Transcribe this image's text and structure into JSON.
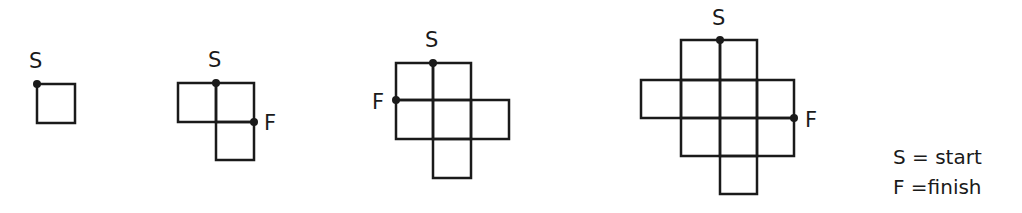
{
  "diagram": {
    "type": "grid-path-figures",
    "stroke_color": "#1a1a1a",
    "background_color": "#ffffff",
    "figures": [
      {
        "id": "figure-1",
        "description": "Single square",
        "cells": [
          [
            0,
            0
          ]
        ],
        "labels": [
          {
            "text": "S",
            "role": "start"
          }
        ]
      },
      {
        "id": "figure-2",
        "description": "Three squares in L shape",
        "cells": [
          [
            0,
            0
          ],
          [
            1,
            0
          ],
          [
            1,
            1
          ]
        ],
        "labels": [
          {
            "text": "S",
            "role": "start"
          },
          {
            "text": "F",
            "role": "finish"
          }
        ]
      },
      {
        "id": "figure-3",
        "description": "Six squares in cross-like shape",
        "cells": [
          [
            0,
            0
          ],
          [
            1,
            0
          ],
          [
            0,
            1
          ],
          [
            1,
            1
          ],
          [
            2,
            1
          ],
          [
            1,
            2
          ]
        ],
        "labels": [
          {
            "text": "S",
            "role": "start"
          },
          {
            "text": "F",
            "role": "finish"
          }
        ]
      },
      {
        "id": "figure-4",
        "description": "Ten squares in larger cross-like shape",
        "cells": [
          [
            1,
            0
          ],
          [
            2,
            0
          ],
          [
            0,
            1
          ],
          [
            1,
            1
          ],
          [
            2,
            1
          ],
          [
            3,
            1
          ],
          [
            1,
            2
          ],
          [
            2,
            2
          ],
          [
            3,
            2
          ],
          [
            2,
            3
          ]
        ],
        "labels": [
          {
            "text": "S",
            "role": "start"
          },
          {
            "text": "F",
            "role": "finish"
          }
        ]
      }
    ]
  },
  "labels": {
    "f1_start": "S",
    "f2_start": "S",
    "f2_finish": "F",
    "f3_start": "S",
    "f3_finish": "F",
    "f4_start": "S",
    "f4_finish": "F"
  },
  "legend": {
    "start_line": "S = start",
    "finish_line": "F =finish"
  }
}
